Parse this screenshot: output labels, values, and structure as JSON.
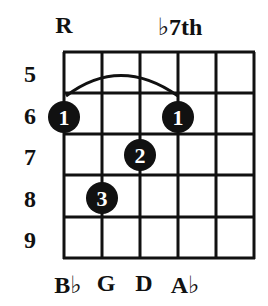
{
  "chord": {
    "top_labels": [
      {
        "text": "R",
        "string_index": 0
      },
      {
        "text": "♭7th",
        "string_index": 3
      }
    ],
    "fret_numbers": [
      "5",
      "6",
      "7",
      "8",
      "9"
    ],
    "string_labels": [
      {
        "text": "B♭",
        "string_index": 0
      },
      {
        "text": "G",
        "string_index": 1
      },
      {
        "text": "D",
        "string_index": 2
      },
      {
        "text": "A♭",
        "string_index": 3
      }
    ],
    "grid": {
      "strings": 6,
      "fret_rows": 5,
      "start_fret": 5
    },
    "barre": {
      "from_string": 0,
      "to_string": 3,
      "fret": 6,
      "finger": "1"
    },
    "fingerings": [
      {
        "string_index": 0,
        "fret": 6,
        "finger": "1"
      },
      {
        "string_index": 3,
        "fret": 6,
        "finger": "1"
      },
      {
        "string_index": 2,
        "fret": 7,
        "finger": "2"
      },
      {
        "string_index": 1,
        "fret": 8,
        "finger": "3"
      }
    ],
    "colors": {
      "line": "#111111",
      "dot": "#111111",
      "dot_text": "#ffffff",
      "background": "#ffffff"
    }
  }
}
